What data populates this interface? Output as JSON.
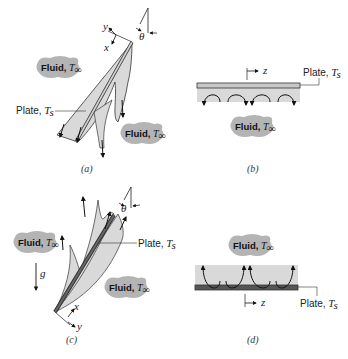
{
  "figure": {
    "panels": [
      {
        "id": "a",
        "caption": "(a)",
        "description": "Inclined plate, cooled (T_s < T_inf), flow descending along lower surface",
        "plate_label": "Plate, ",
        "plate_temp": "T",
        "plate_temp_sub": "s",
        "fluid_labels": [
          {
            "text": "Fluid, ",
            "temp": "T",
            "sub": "∞"
          },
          {
            "text": "Fluid, ",
            "temp": "T",
            "sub": "∞"
          }
        ],
        "axes": {
          "x": "x",
          "y": "y"
        },
        "angle": "θ"
      },
      {
        "id": "b",
        "caption": "(b)",
        "description": "Horizontal plate, cold surface facing down",
        "plate_label": "Plate, ",
        "plate_temp": "T",
        "plate_temp_sub": "s",
        "fluid_labels": [
          {
            "text": "Fluid, ",
            "temp": "T",
            "sub": "∞"
          }
        ],
        "axes": {
          "z": "z"
        }
      },
      {
        "id": "c",
        "caption": "(c)",
        "description": "Inclined plate, heated (T_s > T_inf), flow rising along upper surface",
        "plate_label": "Plate, ",
        "plate_temp": "T",
        "plate_temp_sub": "s",
        "fluid_labels": [
          {
            "text": "Fluid, ",
            "temp": "T",
            "sub": "∞"
          },
          {
            "text": "Fluid, ",
            "temp": "T",
            "sub": "∞"
          }
        ],
        "axes": {
          "x": "x",
          "y": "y"
        },
        "angle": "θ",
        "gravity": "g"
      },
      {
        "id": "d",
        "caption": "(d)",
        "description": "Horizontal plate, hot surface facing up",
        "plate_label": "Plate, ",
        "plate_temp": "T",
        "plate_temp_sub": "s",
        "fluid_labels": [
          {
            "text": "Fluid, ",
            "temp": "T",
            "sub": "∞"
          }
        ],
        "axes": {
          "z": "z"
        }
      }
    ],
    "colors": {
      "boundary_layer_fill": "#d9d9d9",
      "cold_plate": "#c8c8c8",
      "hot_plate": "#555555",
      "cloud_fill": "#b4b4b4",
      "line": "#333333"
    }
  }
}
